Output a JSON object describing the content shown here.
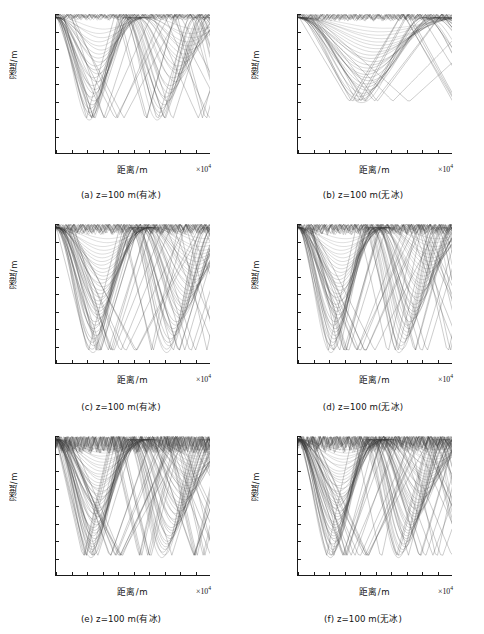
{
  "figure": {
    "axis_labels": {
      "x": "距离/m",
      "y": "深度/m",
      "x_multiplier": "×10",
      "x_exponent": "4"
    },
    "y_ticks": [
      "0",
      "500",
      "1 000",
      "1 500",
      "2 000",
      "2 500",
      "3 000",
      "3 500",
      "4 000"
    ],
    "x_ticks": [
      "0",
      "1",
      "2",
      "3",
      "4",
      "5",
      "6",
      "7",
      "8",
      "9",
      "10"
    ],
    "panels": [
      {
        "id": "a",
        "caption": "(a) z=100 m(有冰)",
        "label": "(a)",
        "variable": "z",
        "value": "=100 m",
        "condition": "(有冰)"
      },
      {
        "id": "b",
        "caption": "(b) z=100 m(无冰)",
        "label": "(b)",
        "variable": "z",
        "value": "=100 m",
        "condition": "(无冰)"
      },
      {
        "id": "c",
        "caption": "(c) z=100 m(有冰)",
        "label": "(c)",
        "variable": "z",
        "value": "=100 m",
        "condition": "(有冰)"
      },
      {
        "id": "d",
        "caption": "(d) z=100 m(无冰)",
        "label": "(d)",
        "variable": "z",
        "value": "=100 m",
        "condition": "(无冰)"
      },
      {
        "id": "e",
        "caption": "(e) z=100 m(有冰)",
        "label": "(e)",
        "variable": "z",
        "value": "=100 m",
        "condition": "(有冰)"
      },
      {
        "id": "f",
        "caption": "(f) z=100 m(无冰)",
        "label": "(f)",
        "variable": "z",
        "value": "=100 m",
        "condition": "(无冰)"
      }
    ]
  },
  "chart_data": [
    {
      "type": "line",
      "id": "a",
      "title": "(a) z=100 m(有冰)",
      "xlabel": "距离/m",
      "ylabel": "深度/m",
      "xlim": [
        0,
        100000
      ],
      "ylim": [
        0,
        4000
      ],
      "y_inverted": true,
      "grid": false,
      "legend": "none",
      "x_tick_values": [
        0,
        10000,
        20000,
        30000,
        40000,
        50000,
        60000,
        70000,
        80000,
        90000,
        100000
      ],
      "y_tick_values": [
        0,
        500,
        1000,
        1500,
        2000,
        2500,
        3000,
        3500,
        4000
      ],
      "description": "Ray trace from a 100 m source with ice cover; surface-duct rays trapped above ~200 m plus refracted rays turning between 500 m and 3 000 m, convergence zones near 2.4e4 m and 7.0e4 m",
      "source_depth": 100,
      "max_turning_depth": 3050,
      "convergence_zones": [
        24000,
        44000,
        67000,
        90000
      ],
      "n_rays": 44,
      "launch_angle_range_deg": [
        -14,
        14
      ],
      "ray_color": "#3a3a3a"
    },
    {
      "type": "line",
      "id": "b",
      "title": "(b) z=100 m(无冰)",
      "xlabel": "距离/m",
      "ylabel": "深度/m",
      "xlim": [
        0,
        100000
      ],
      "ylim": [
        0,
        4000
      ],
      "y_inverted": true,
      "grid": false,
      "legend": "none",
      "x_tick_values": [
        0,
        10000,
        20000,
        30000,
        40000,
        50000,
        60000,
        70000,
        80000,
        90000,
        100000
      ],
      "y_tick_values": [
        0,
        500,
        1000,
        1500,
        2000,
        2500,
        3000,
        3500,
        4000
      ],
      "description": "Ray trace from a 100 m source without ice cover; dense surface-bounce rays concentrated above 200 m, fewer deep refracted paths reaching ~2 500 m",
      "source_depth": 100,
      "max_turning_depth": 2550,
      "convergence_zones": [
        44000,
        58000,
        86000
      ],
      "n_rays": 44,
      "launch_angle_range_deg": [
        -14,
        14
      ],
      "ray_color": "#3a3a3a"
    },
    {
      "type": "line",
      "id": "c",
      "title": "(c) z=100 m(有冰)",
      "xlabel": "距离/m",
      "ylabel": "深度/m",
      "xlim": [
        0,
        100000
      ],
      "ylim": [
        0,
        4000
      ],
      "y_inverted": true,
      "grid": false,
      "legend": "none",
      "x_tick_values": [
        0,
        10000,
        20000,
        30000,
        40000,
        50000,
        60000,
        70000,
        80000,
        90000,
        100000
      ],
      "y_tick_values": [
        0,
        500,
        1000,
        1500,
        2000,
        2500,
        3000,
        3500,
        4000
      ],
      "description": "Ray trace with ice cover, wider launch-angle fan; rays turn as deep as 3 700 m with convergence zones near 2.6e4 m and 7.2e4 m",
      "source_depth": 100,
      "max_turning_depth": 3700,
      "convergence_zones": [
        26000,
        45000,
        72000,
        88000
      ],
      "n_rays": 60,
      "launch_angle_range_deg": [
        -18,
        18
      ],
      "ray_color": "#3a3a3a"
    },
    {
      "type": "line",
      "id": "d",
      "title": "(d) z=100 m(无冰)",
      "xlabel": "距离/m",
      "ylabel": "深度/m",
      "xlim": [
        0,
        100000
      ],
      "ylim": [
        0,
        4000
      ],
      "y_inverted": true,
      "grid": false,
      "legend": "none",
      "x_tick_values": [
        0,
        10000,
        20000,
        30000,
        40000,
        50000,
        60000,
        70000,
        80000,
        90000,
        100000
      ],
      "y_tick_values": [
        0,
        500,
        1000,
        1500,
        2000,
        2500,
        3000,
        3500,
        4000
      ],
      "description": "Ray trace without ice cover, wider launch-angle fan; turning depths reach 3 700 m with convergence zones near 2.4e4 m and 7.2e4 m",
      "source_depth": 100,
      "max_turning_depth": 3700,
      "convergence_zones": [
        24000,
        45000,
        72000,
        90000
      ],
      "n_rays": 60,
      "launch_angle_range_deg": [
        -18,
        18
      ],
      "ray_color": "#3a3a3a"
    },
    {
      "type": "line",
      "id": "e",
      "title": "(e) z=100 m(有冰)",
      "xlabel": "距离/m",
      "ylabel": "深度/m",
      "xlim": [
        0,
        100000
      ],
      "ylim": [
        0,
        4000
      ],
      "y_inverted": true,
      "grid": false,
      "legend": "none",
      "x_tick_values": [
        0,
        10000,
        20000,
        30000,
        40000,
        50000,
        60000,
        70000,
        80000,
        90000,
        100000
      ],
      "y_tick_values": [
        0,
        500,
        1000,
        1500,
        2000,
        2500,
        3000,
        3500,
        4000
      ],
      "description": "Ray trace with ice cover, widest launch-angle fan; heavy surface interaction above 500 m, deepest turning near 3 500 m, convergence zones near 2.5e4 m and 7.0e4 m",
      "source_depth": 100,
      "max_turning_depth": 3500,
      "convergence_zones": [
        25000,
        44000,
        70000,
        90000
      ],
      "n_rays": 70,
      "launch_angle_range_deg": [
        -20,
        20
      ],
      "ray_color": "#3a3a3a"
    },
    {
      "type": "line",
      "id": "f",
      "title": "(f) z=100 m(无冰)",
      "xlabel": "距离/m",
      "ylabel": "深度/m",
      "xlim": [
        0,
        100000
      ],
      "ylim": [
        0,
        4000
      ],
      "y_inverted": true,
      "grid": false,
      "legend": "none",
      "x_tick_values": [
        0,
        10000,
        20000,
        30000,
        40000,
        50000,
        60000,
        70000,
        80000,
        90000,
        100000
      ],
      "y_tick_values": [
        0,
        500,
        1000,
        1500,
        2000,
        2500,
        3000,
        3500,
        4000
      ],
      "description": "Ray trace without ice cover, widest launch-angle fan; dense surface-reflected bundle above 500 m, deepest turning near 3 500 m, convergence zones near 2.4e4 m and 6.8e4 m",
      "source_depth": 100,
      "max_turning_depth": 3500,
      "convergence_zones": [
        24000,
        44000,
        68000,
        88000
      ],
      "n_rays": 70,
      "launch_angle_range_deg": [
        -20,
        20
      ],
      "ray_color": "#3a3a3a"
    }
  ]
}
